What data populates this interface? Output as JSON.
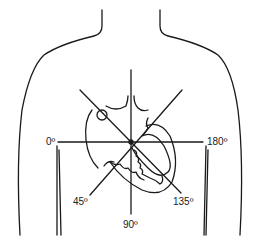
{
  "diagram": {
    "axis_labels": {
      "left": "0º",
      "right": "180º",
      "lower_left": "45º",
      "lower_right": "135º",
      "bottom": "90º"
    },
    "colors": {
      "stroke": "#1a1a1a",
      "background": "#ffffff"
    }
  }
}
